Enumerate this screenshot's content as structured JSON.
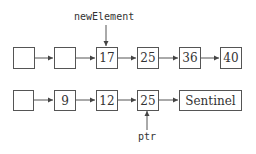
{
  "diagram": {
    "top_list": {
      "pointer_label": "newElement",
      "nodes": [
        "",
        "",
        "17",
        "25",
        "36",
        "40"
      ]
    },
    "bottom_list": {
      "pointer_label": "ptr",
      "nodes": [
        "",
        "9",
        "12",
        "25",
        "Sentinel"
      ]
    },
    "colors": {
      "line": "#555555",
      "text": "#333333",
      "background": "#ffffff"
    }
  }
}
